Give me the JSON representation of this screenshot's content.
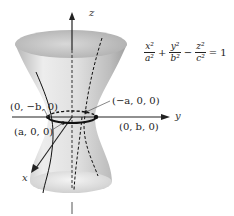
{
  "diagram": {
    "equation": {
      "terms": [
        {
          "num": "x²",
          "den": "a²"
        },
        {
          "op": "+"
        },
        {
          "num": "y²",
          "den": "b²"
        },
        {
          "op": "−"
        },
        {
          "num": "z²",
          "den": "c²"
        },
        {
          "op": "= 1"
        }
      ]
    },
    "axes": {
      "x": "x",
      "y": "y",
      "z": "z"
    },
    "points": [
      {
        "id": "p-0-negb-0",
        "label": "(0, −b, 0)"
      },
      {
        "id": "p-nega-0-0",
        "label": "(−a, 0, 0)"
      },
      {
        "id": "p-a-0-0",
        "label": "(a, 0, 0)"
      },
      {
        "id": "p-0-b-0",
        "label": "(0, b, 0)"
      }
    ],
    "colors": {
      "surface_light": "#f2f2f2",
      "surface_mid": "#d6d6d6",
      "surface_dark": "#a8a8a8",
      "line": "#111111",
      "axis": "#333333"
    }
  }
}
